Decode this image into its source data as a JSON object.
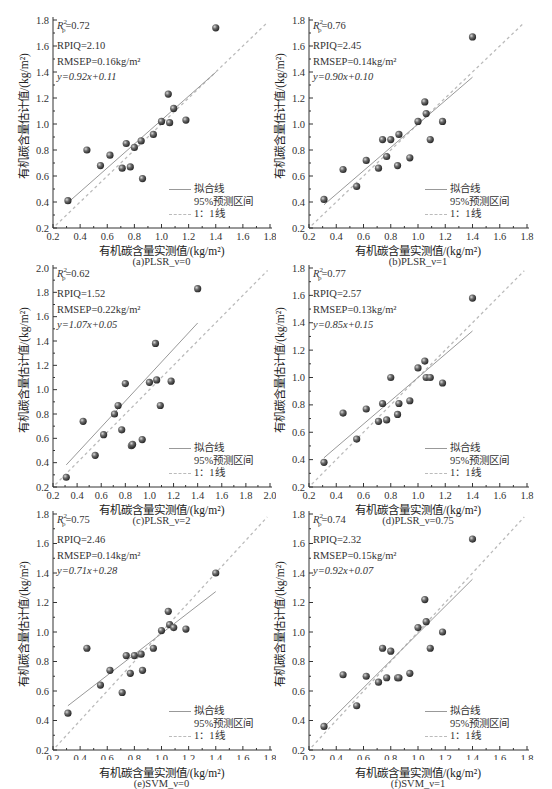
{
  "figure": {
    "y_axis_label": "有机碳含量估计值/(kg/m²)",
    "x_axis_label": "有机碳含量实测值/(kg/m²)",
    "legend": {
      "fit_line": "拟合线",
      "prediction_interval": "95%预测区间",
      "one_to_one": "1：1线"
    },
    "colors": {
      "fit_line": "#999999",
      "one_to_one": "#bbbbbb",
      "point": "#4a4a4a",
      "axis": "#333333"
    }
  },
  "panels": [
    {
      "caption": "(a)PLSR_ν=0",
      "r2": "=0.72",
      "rpiq": "RPIQ=2.10",
      "rmsep": "RMSEP=0.16kg/m²",
      "eq": "y=0.92x+0.11"
    },
    {
      "caption": "(b)PLSR_ν=1",
      "r2": "=0.76",
      "rpiq": "RPIQ=2.45",
      "rmsep": "RMSEP=0.14kg/m²",
      "eq": "y=0.90x+0.10"
    },
    {
      "caption": "(c)PLSR_ν=2",
      "r2": "=0.62",
      "rpiq": "RPIQ=1.52",
      "rmsep": "RMSEP=0.22kg/m²",
      "eq": "y=1.07x+0.05"
    },
    {
      "caption": "(d)PLSR_ν=0.75",
      "r2": "=0.77",
      "rpiq": "RPIQ=2.57",
      "rmsep": "RMSEP=0.13kg/m²",
      "eq": "y=0.85x+0.15"
    },
    {
      "caption": "(e)SVM_ν=0",
      "r2": "=0.75",
      "rpiq": "RPIQ=2.46",
      "rmsep": "RMSEP=0.14kg/m²",
      "eq": "y=0.71x+0.28"
    },
    {
      "caption": "(f)SVM_ν=1",
      "r2": "=0.74",
      "rpiq": "RPIQ=2.32",
      "rmsep": "RMSEP=0.15kg/m²",
      "eq": "y=0.92x+0.07"
    }
  ],
  "chart_data": [
    {
      "type": "scatter",
      "title": "(a)PLSR_ν=0",
      "xlabel": "有机碳含量实测值/(kg/m²)",
      "ylabel": "有机碳含量估计值/(kg/m²)",
      "xlim": [
        0.2,
        1.8
      ],
      "ylim": [
        0.2,
        1.8
      ],
      "xticks": [
        0.2,
        0.4,
        0.6,
        0.8,
        1.0,
        1.2,
        1.4,
        1.6,
        1.8
      ],
      "yticks": [
        0.2,
        0.4,
        0.6,
        0.8,
        1.0,
        1.2,
        1.4,
        1.6,
        1.8
      ],
      "x": [
        0.31,
        0.45,
        0.55,
        0.62,
        0.71,
        0.74,
        0.77,
        0.8,
        0.85,
        0.86,
        0.94,
        1.0,
        1.05,
        1.06,
        1.09,
        1.18,
        1.4
      ],
      "y": [
        0.41,
        0.8,
        0.68,
        0.76,
        0.66,
        0.85,
        0.67,
        0.82,
        0.87,
        0.58,
        0.92,
        1.02,
        1.23,
        1.01,
        1.12,
        1.03,
        1.74
      ],
      "fit": {
        "slope": 0.92,
        "intercept": 0.11,
        "x_range": [
          0.31,
          1.4
        ]
      },
      "annotations": [
        "R²p=0.72",
        "RPIQ=2.10",
        "RMSEP=0.16kg/m²",
        "y=0.92x+0.11"
      ],
      "legend": [
        "拟合线",
        "95%预测区间",
        "1：1线"
      ],
      "legend_position": "lower right",
      "grid": false
    },
    {
      "type": "scatter",
      "title": "(b)PLSR_ν=1",
      "xlabel": "有机碳含量实测值/(kg/m²)",
      "ylabel": "有机碳含量估计值/(kg/m²)",
      "xlim": [
        0.2,
        1.8
      ],
      "ylim": [
        0.2,
        1.8
      ],
      "xticks": [
        0.2,
        0.4,
        0.6,
        0.8,
        1.0,
        1.2,
        1.4,
        1.6,
        1.8
      ],
      "yticks": [
        0.2,
        0.4,
        0.6,
        0.8,
        1.0,
        1.2,
        1.4,
        1.6,
        1.8
      ],
      "x": [
        0.31,
        0.45,
        0.55,
        0.62,
        0.71,
        0.74,
        0.77,
        0.8,
        0.85,
        0.86,
        0.94,
        1.0,
        1.05,
        1.06,
        1.09,
        1.18,
        1.4
      ],
      "y": [
        0.42,
        0.65,
        0.52,
        0.72,
        0.66,
        0.88,
        0.75,
        0.88,
        0.68,
        0.92,
        0.74,
        1.02,
        1.17,
        1.08,
        0.88,
        1.02,
        1.67
      ],
      "fit": {
        "slope": 0.9,
        "intercept": 0.1,
        "x_range": [
          0.31,
          1.4
        ]
      },
      "annotations": [
        "R²p=0.76",
        "RPIQ=2.45",
        "RMSEP=0.14kg/m²",
        "y=0.90x+0.10"
      ],
      "legend": [
        "拟合线",
        "95%预测区间",
        "1：1线"
      ],
      "legend_position": "lower right",
      "grid": false
    },
    {
      "type": "scatter",
      "title": "(c)PLSR_ν=2",
      "xlabel": "有机碳含量实测值/(kg/m²)",
      "ylabel": "有机碳含量估计值/(kg/m²)",
      "xlim": [
        0.2,
        2.0
      ],
      "ylim": [
        0.2,
        2.0
      ],
      "xticks": [
        0.2,
        0.4,
        0.6,
        0.8,
        1.0,
        1.2,
        1.4,
        1.6,
        1.8,
        2.0
      ],
      "yticks": [
        0.2,
        0.4,
        0.6,
        0.8,
        1.0,
        1.2,
        1.4,
        1.6,
        1.8,
        2.0
      ],
      "x": [
        0.31,
        0.45,
        0.55,
        0.62,
        0.71,
        0.74,
        0.77,
        0.8,
        0.85,
        0.86,
        0.94,
        1.0,
        1.05,
        1.06,
        1.09,
        1.18,
        1.4
      ],
      "y": [
        0.28,
        0.74,
        0.46,
        0.63,
        0.8,
        0.87,
        0.67,
        1.05,
        0.54,
        0.55,
        0.59,
        1.06,
        1.38,
        1.08,
        0.87,
        1.07,
        1.83
      ],
      "fit": {
        "slope": 1.07,
        "intercept": 0.05,
        "x_range": [
          0.31,
          1.4
        ]
      },
      "annotations": [
        "R²p=0.62",
        "RPIQ=1.52",
        "RMSEP=0.22kg/m²",
        "y=1.07x+0.05"
      ],
      "legend": [
        "拟合线",
        "95%预测区间",
        "1：1线"
      ],
      "legend_position": "lower right",
      "grid": false
    },
    {
      "type": "scatter",
      "title": "(d)PLSR_ν=0.75",
      "xlabel": "有机碳含量实测值/(kg/m²)",
      "ylabel": "有机碳含量估计值/(kg/m²)",
      "xlim": [
        0.2,
        1.8
      ],
      "ylim": [
        0.2,
        1.8
      ],
      "xticks": [
        0.2,
        0.4,
        0.6,
        0.8,
        1.0,
        1.2,
        1.4,
        1.6,
        1.8
      ],
      "yticks": [
        0.2,
        0.4,
        0.6,
        0.8,
        1.0,
        1.2,
        1.4,
        1.6,
        1.8
      ],
      "x": [
        0.31,
        0.45,
        0.55,
        0.62,
        0.71,
        0.74,
        0.77,
        0.8,
        0.85,
        0.86,
        0.94,
        1.0,
        1.05,
        1.06,
        1.09,
        1.18,
        1.4
      ],
      "y": [
        0.38,
        0.74,
        0.55,
        0.77,
        0.68,
        0.81,
        0.69,
        1.0,
        0.73,
        0.81,
        0.83,
        1.07,
        1.12,
        1.0,
        1.0,
        0.96,
        1.58
      ],
      "fit": {
        "slope": 0.85,
        "intercept": 0.15,
        "x_range": [
          0.31,
          1.4
        ]
      },
      "annotations": [
        "R²p=0.77",
        "RPIQ=2.57",
        "RMSEP=0.13kg/m²",
        "y=0.85x+0.15"
      ],
      "legend": [
        "拟合线",
        "95%预测区间",
        "1：1线"
      ],
      "legend_position": "lower right",
      "grid": false
    },
    {
      "type": "scatter",
      "title": "(e)SVM_ν=0",
      "xlabel": "有机碳含量实测值/(kg/m²)",
      "ylabel": "有机碳含量估计值/(kg/m²)",
      "xlim": [
        0.2,
        1.8
      ],
      "ylim": [
        0.2,
        1.8
      ],
      "xticks": [
        0.2,
        0.4,
        0.6,
        0.8,
        1.0,
        1.2,
        1.4,
        1.6,
        1.8
      ],
      "yticks": [
        0.2,
        0.4,
        0.6,
        0.8,
        1.0,
        1.2,
        1.4,
        1.6,
        1.8
      ],
      "x": [
        0.31,
        0.45,
        0.55,
        0.62,
        0.71,
        0.74,
        0.77,
        0.8,
        0.85,
        0.86,
        0.94,
        1.0,
        1.05,
        1.06,
        1.09,
        1.18,
        1.4
      ],
      "y": [
        0.45,
        0.89,
        0.64,
        0.74,
        0.59,
        0.84,
        0.72,
        0.84,
        0.85,
        0.74,
        0.89,
        1.01,
        1.14,
        1.05,
        1.03,
        1.02,
        1.4
      ],
      "fit": {
        "slope": 0.71,
        "intercept": 0.28,
        "x_range": [
          0.31,
          1.4
        ]
      },
      "annotations": [
        "R²p=0.75",
        "RPIQ=2.46",
        "RMSEP=0.14kg/m²",
        "y=0.71x+0.28"
      ],
      "legend": [
        "拟合线",
        "95%预测区间",
        "1：1线"
      ],
      "legend_position": "lower right",
      "grid": false
    },
    {
      "type": "scatter",
      "title": "(f)SVM_ν=1",
      "xlabel": "有机碳含量实测值/(kg/m²)",
      "ylabel": "有机碳含量估计值/(kg/m²)",
      "xlim": [
        0.2,
        1.8
      ],
      "ylim": [
        0.2,
        1.8
      ],
      "xticks": [
        0.2,
        0.4,
        0.6,
        0.8,
        1.0,
        1.2,
        1.4,
        1.6,
        1.8
      ],
      "yticks": [
        0.2,
        0.4,
        0.6,
        0.8,
        1.0,
        1.2,
        1.4,
        1.6,
        1.8
      ],
      "x": [
        0.31,
        0.45,
        0.55,
        0.62,
        0.71,
        0.74,
        0.77,
        0.8,
        0.85,
        0.86,
        0.94,
        1.0,
        1.05,
        1.06,
        1.09,
        1.18,
        1.4
      ],
      "y": [
        0.36,
        0.71,
        0.5,
        0.7,
        0.66,
        0.89,
        0.69,
        0.87,
        0.69,
        0.69,
        0.72,
        1.03,
        1.22,
        1.07,
        0.89,
        1.0,
        1.63
      ],
      "fit": {
        "slope": 0.92,
        "intercept": 0.07,
        "x_range": [
          0.31,
          1.4
        ]
      },
      "annotations": [
        "R²p=0.74",
        "RPIQ=2.32",
        "RMSEP=0.15kg/m²",
        "y=0.92x+0.07"
      ],
      "legend": [
        "拟合线",
        "95%预测区间",
        "1：1线"
      ],
      "legend_position": "lower right",
      "grid": false
    }
  ]
}
